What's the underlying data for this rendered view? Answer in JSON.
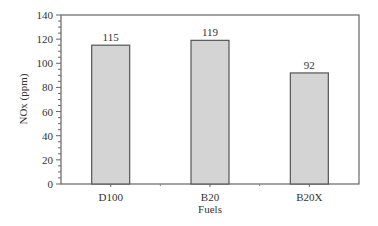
{
  "chart_data": {
    "type": "bar",
    "title": "",
    "xlabel": "Fuels",
    "ylabel": "NOx (ppm)",
    "categories": [
      "D100",
      "B20",
      "B20X"
    ],
    "values": [
      115,
      119,
      92
    ],
    "data_labels": [
      "115",
      "119",
      "92"
    ],
    "ylim": [
      0,
      140
    ],
    "yticks": [
      0,
      20,
      40,
      60,
      80,
      100,
      120,
      140
    ],
    "y_minor_tick_step": 5,
    "grid": false,
    "legend": null,
    "bar_color": "#d4d4d4",
    "bar_edge_color": "#555555"
  }
}
